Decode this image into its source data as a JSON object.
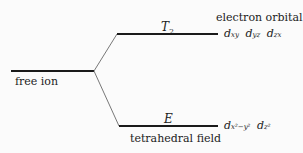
{
  "diagram": {
    "levels": {
      "free_ion": {
        "label": "free ion"
      },
      "upper": {
        "label": "T",
        "label_sub": "2",
        "orbitals": [
          {
            "base": "d",
            "sub": "xy"
          },
          {
            "base": "d",
            "sub": "yz"
          },
          {
            "base": "d",
            "sub": "zx"
          }
        ]
      },
      "lower": {
        "label": "E",
        "orbitals": [
          {
            "base": "d",
            "sub": "x²−y²"
          },
          {
            "base": "d",
            "sub": "z²"
          }
        ]
      }
    },
    "column_header": "electron orbital",
    "field_label": "tetrahedral field",
    "colors": {
      "line": "#1a1a1a",
      "background": "#fbfbfb",
      "text": "#222222"
    }
  }
}
